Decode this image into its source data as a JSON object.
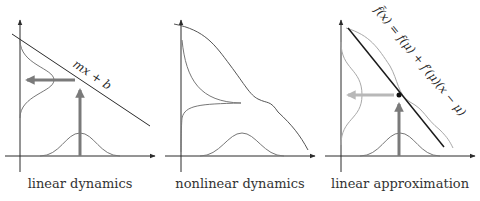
{
  "figure": {
    "panels": [
      {
        "id": "linear",
        "caption": "linear dynamics",
        "function_label": "mx + b"
      },
      {
        "id": "nonlinear",
        "caption": "nonlinear dynamics"
      },
      {
        "id": "approximation",
        "caption": "linear approximation",
        "function_label": "f̃(x) = f(μ) + f′(μ)(x − μ)"
      }
    ],
    "colors": {
      "axis": "#2b2b2b",
      "curve": "#777777",
      "arrow": "#7a7a7a",
      "arrow_light": "#b8b8b8",
      "tangent": "#1a1a1a",
      "nonlinear_light": "#a8a8a8",
      "point": "#111111"
    }
  }
}
